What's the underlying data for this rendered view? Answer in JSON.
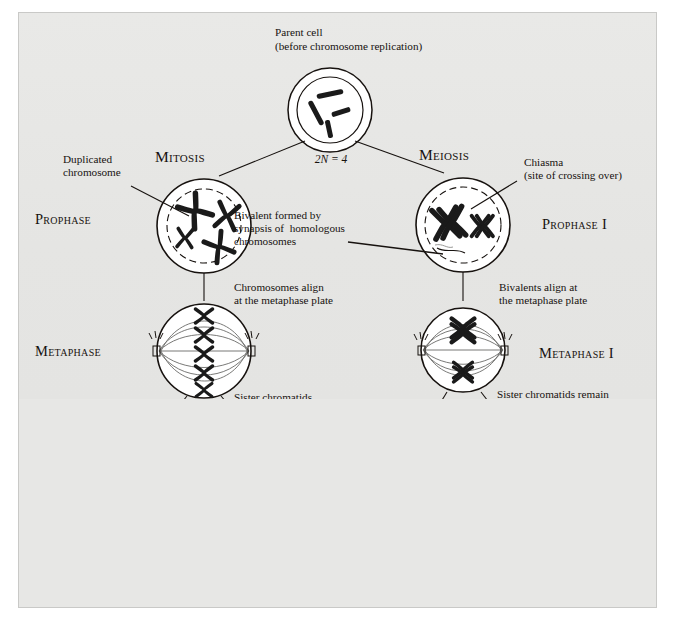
{
  "diagram": {
    "title_left": "Mitosis",
    "title_right": "Meiosis",
    "parent": {
      "label_line1": "Parent cell",
      "label_line2": "(before chromosome replication)",
      "ploidy": "2N = 4"
    },
    "annotations": {
      "duplicated_chromosome": "Duplicated\nchromosome",
      "chiasma": "Chiasma\n(site of crossing over)",
      "bivalent": "Bivalent formed by\nsynapsis of  homologous\nchromosomes",
      "mitosis_metaphase_note": "Chromosomes align\nat the metaphase plate",
      "meiosis_metaphase_note": "Bivalents align at\nthe metaphase plate",
      "mitosis_anaphase_note": "Sister chromatids\nseparate during anaphase",
      "meiosis_anaphase_note": "Sister chromatids remain\ntogether during anaphase I",
      "no_further_replication": "No further\nchromosomal\nreplication; sister\nchromatids separate\nduring anaphase II"
    },
    "stages": {
      "prophase": "Prophase",
      "prophase_i": "Prophase I",
      "metaphase": "Metaphase",
      "metaphase_i": "Metaphase I",
      "daughter_cells": "Daughter\nCells",
      "daughter_cells_meiosis_i": "Daughter cells\nof meiosis I",
      "daughter_cells_meiosis_ii": "Daughter\nCells\nof meiosis II"
    },
    "ploidy_labels": {
      "mitosis_left": "2N",
      "mitosis_right": "2N",
      "meiosis_ii": [
        "N",
        "N",
        "N",
        "N"
      ]
    },
    "colors": {
      "background": "#e6e6e4",
      "page": "#ffffff",
      "ink": "#17120f",
      "cell_fill": "#ffffff",
      "chromosome": "#1a1a1a"
    }
  }
}
